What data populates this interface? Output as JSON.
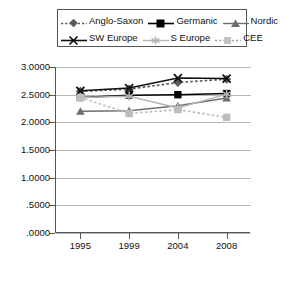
{
  "chart_data": {
    "type": "line",
    "title": "",
    "xlabel": "",
    "ylabel": "",
    "categories": [
      "1995",
      "1999",
      "2004",
      "2008"
    ],
    "ylim": [
      0.0,
      3.0
    ],
    "ytick_labels": [
      "3.0000",
      "2.5000",
      "2.0000",
      "1.5000",
      "1.0000",
      ".5000",
      ".0000"
    ],
    "ytick_values": [
      3.0,
      2.5,
      2.0,
      1.5,
      1.0,
      0.5,
      0.0
    ],
    "grid": true,
    "legend_position": "top",
    "series": [
      {
        "name": "Anglo-Saxon",
        "values": [
          2.56,
          2.6,
          2.72,
          2.78
        ],
        "color": "#595959",
        "line_style": "dotted",
        "marker": "diamond"
      },
      {
        "name": "Germanic",
        "values": [
          2.45,
          2.49,
          2.5,
          2.52
        ],
        "color": "#000000",
        "line_style": "solid",
        "marker": "square"
      },
      {
        "name": "Nordic",
        "values": [
          2.2,
          2.21,
          2.3,
          2.44
        ],
        "color": "#6e6e6e",
        "line_style": "solid",
        "marker": "triangle"
      },
      {
        "name": "SW Europe",
        "values": [
          2.57,
          2.62,
          2.8,
          2.79
        ],
        "color": "#111111",
        "line_style": "solid",
        "marker": "x"
      },
      {
        "name": "S Europe",
        "values": [
          2.45,
          2.47,
          2.26,
          2.51
        ],
        "color": "#b5b5b5",
        "line_style": "solid",
        "marker": "star"
      },
      {
        "name": "CEE",
        "values": [
          2.45,
          2.16,
          2.23,
          2.09
        ],
        "color": "#bdbdbd",
        "line_style": "dotted",
        "marker": "square"
      }
    ]
  },
  "legend": {
    "rows": [
      [
        {
          "label": "Anglo-Saxon",
          "key": "anglo-saxon-legend-key"
        },
        {
          "label": "Germanic",
          "key": "germanic-legend-key"
        },
        {
          "label": "Nordic",
          "key": "nordic-legend-key"
        }
      ],
      [
        {
          "label": "SW Europe",
          "key": "sw-europe-legend-key"
        },
        {
          "label": "S Europe",
          "key": "s-europe-legend-key"
        },
        {
          "label": "CEE",
          "key": "cee-legend-key"
        }
      ]
    ]
  },
  "footer": {
    "cut_text": ""
  }
}
